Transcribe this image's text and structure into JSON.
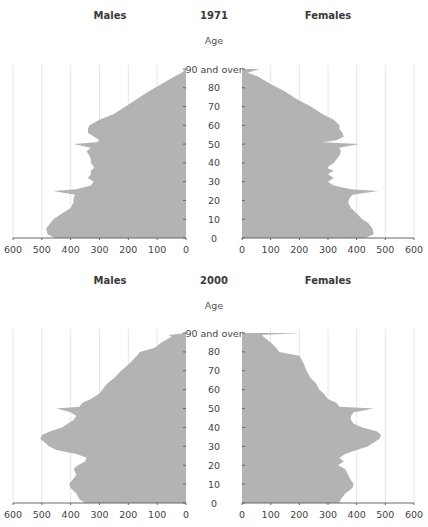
{
  "chart_data": [
    {
      "type": "population_pyramid",
      "title": "1971",
      "left_label": "Males",
      "right_label": "Females",
      "age_axis_label": "Age",
      "age_ticks": [
        "0",
        "10",
        "20",
        "30",
        "40",
        "50",
        "60",
        "70",
        "80",
        "90 and over"
      ],
      "x_ticks": [
        0,
        100,
        200,
        300,
        400,
        500,
        600
      ],
      "xlim": [
        0,
        600
      ],
      "grid": true,
      "males": {
        "ages": [
          0,
          2,
          5,
          8,
          10,
          13,
          16,
          19,
          21,
          23,
          25,
          26,
          28,
          30,
          32,
          34,
          36,
          37,
          38,
          40,
          42,
          44,
          46,
          48,
          50,
          51,
          52,
          54,
          56,
          58,
          60,
          63,
          66,
          70,
          74,
          78,
          82,
          86,
          88,
          90
        ],
        "values": [
          455,
          480,
          485,
          470,
          460,
          430,
          400,
          390,
          390,
          385,
          460,
          380,
          330,
          320,
          340,
          330,
          330,
          320,
          320,
          330,
          330,
          335,
          345,
          330,
          390,
          310,
          300,
          320,
          340,
          340,
          335,
          300,
          250,
          210,
          170,
          130,
          85,
          40,
          15,
          0
        ]
      },
      "females": {
        "ages": [
          0,
          2,
          5,
          8,
          10,
          13,
          16,
          19,
          21,
          23,
          25,
          26,
          28,
          30,
          32,
          34,
          36,
          37,
          38,
          40,
          42,
          44,
          46,
          48,
          50,
          51,
          52,
          54,
          56,
          58,
          60,
          63,
          66,
          70,
          74,
          78,
          82,
          86,
          88,
          90
        ],
        "values": [
          430,
          460,
          455,
          440,
          420,
          400,
          380,
          370,
          375,
          385,
          475,
          380,
          320,
          300,
          320,
          300,
          320,
          300,
          300,
          320,
          330,
          340,
          345,
          340,
          410,
          280,
          330,
          355,
          350,
          340,
          340,
          320,
          280,
          240,
          190,
          150,
          100,
          55,
          20,
          60
        ]
      }
    },
    {
      "type": "population_pyramid",
      "title": "2000",
      "left_label": "Males",
      "right_label": "Females",
      "age_axis_label": "Age",
      "age_ticks": [
        "0",
        "10",
        "20",
        "30",
        "40",
        "50",
        "60",
        "70",
        "80",
        "90 and over"
      ],
      "x_ticks": [
        0,
        100,
        200,
        300,
        400,
        500,
        600
      ],
      "xlim": [
        0,
        600
      ],
      "grid": true,
      "males": {
        "ages": [
          0,
          2,
          5,
          8,
          10,
          12,
          15,
          18,
          20,
          22,
          24,
          26,
          28,
          30,
          32,
          34,
          36,
          38,
          40,
          42,
          44,
          46,
          48,
          50,
          51,
          53,
          55,
          58,
          60,
          63,
          66,
          70,
          74,
          78,
          80,
          82,
          85,
          88,
          89,
          90
        ],
        "values": [
          350,
          370,
          380,
          400,
          405,
          395,
          380,
          390,
          375,
          350,
          345,
          380,
          450,
          475,
          490,
          505,
          500,
          470,
          430,
          410,
          390,
          380,
          400,
          450,
          370,
          360,
          330,
          300,
          290,
          275,
          250,
          225,
          195,
          170,
          160,
          110,
          85,
          50,
          60,
          0
        ]
      },
      "females": {
        "ages": [
          0,
          2,
          5,
          8,
          10,
          12,
          15,
          18,
          20,
          22,
          24,
          26,
          28,
          30,
          32,
          34,
          36,
          38,
          40,
          42,
          44,
          46,
          48,
          50,
          51,
          53,
          55,
          58,
          60,
          63,
          66,
          70,
          74,
          78,
          80,
          82,
          85,
          88,
          89,
          90
        ],
        "values": [
          340,
          345,
          360,
          385,
          390,
          380,
          370,
          360,
          335,
          355,
          340,
          360,
          400,
          440,
          460,
          480,
          485,
          470,
          420,
          390,
          380,
          380,
          390,
          460,
          340,
          330,
          300,
          285,
          270,
          260,
          240,
          225,
          215,
          200,
          130,
          120,
          100,
          75,
          70,
          200
        ]
      }
    }
  ],
  "panels": [
    {
      "title": "1971",
      "left": "Males",
      "right": "Females",
      "age": "Age"
    },
    {
      "title": "2000",
      "left": "Males",
      "right": "Females",
      "age": "Age"
    }
  ],
  "colors": {
    "fill": "#b3b3b3",
    "axis": "#666666",
    "grid": "#e6e6e6",
    "text": "#444444"
  }
}
